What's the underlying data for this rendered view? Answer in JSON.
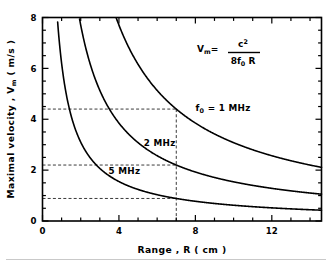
{
  "figure": {
    "background_color": "#ffffff",
    "ink_color": "#000000",
    "dash_color": "#3a3a3a",
    "footer_rule": true
  },
  "formula": {
    "lhs": "V",
    "lhs_sub": "m",
    "equals": "=",
    "numerator": "c",
    "numerator_sup": "2",
    "denominator_pre": "8f",
    "denominator_sub": "0",
    "denominator_post": "R",
    "full_text": "Vm = c2 / 8f0R"
  },
  "chart_data": {
    "type": "line",
    "title": "",
    "subtitle": "",
    "xlabel": "Range ,  R   ( cm )",
    "ylabel": "Maximal velocity ,  V_m  ( m/s )",
    "xlim": [
      0,
      14.6
    ],
    "ylim": [
      0,
      8
    ],
    "xticks": [
      0,
      4,
      8,
      12
    ],
    "xtick_labels": [
      "0",
      "4",
      "8",
      "12"
    ],
    "xminor_step": 1,
    "yticks": [
      0,
      2,
      4,
      6,
      8
    ],
    "ytick_labels": [
      "0",
      "2",
      "4",
      "6",
      "8"
    ],
    "yminor_step": 0.5,
    "grid": false,
    "legend_position": "inline-curve-labels",
    "relation": "Vm = k / R",
    "series": [
      {
        "name": "f0 = 1 MHz",
        "label": "f₀ =  1  MHz",
        "k": 30.8,
        "label_x": 8.0,
        "label_y": 4.45,
        "points": [
          {
            "x": 3.85,
            "y": 8.0
          },
          {
            "x": 4.5,
            "y": 6.84
          },
          {
            "x": 5.5,
            "y": 5.6
          },
          {
            "x": 6.5,
            "y": 4.74
          },
          {
            "x": 7.0,
            "y": 4.4
          },
          {
            "x": 8.0,
            "y": 3.85
          },
          {
            "x": 9.0,
            "y": 3.42
          },
          {
            "x": 10.0,
            "y": 3.08
          },
          {
            "x": 11.0,
            "y": 2.8
          },
          {
            "x": 12.0,
            "y": 2.57
          },
          {
            "x": 13.0,
            "y": 2.37
          },
          {
            "x": 14.0,
            "y": 2.2
          },
          {
            "x": 14.6,
            "y": 2.11
          }
        ]
      },
      {
        "name": "2 MHz",
        "label": "2  MHz",
        "k": 15.4,
        "label_x": 5.3,
        "label_y": 3.05,
        "points": [
          {
            "x": 1.93,
            "y": 8.0
          },
          {
            "x": 2.5,
            "y": 6.16
          },
          {
            "x": 3.0,
            "y": 5.13
          },
          {
            "x": 4.0,
            "y": 3.85
          },
          {
            "x": 5.0,
            "y": 3.08
          },
          {
            "x": 6.0,
            "y": 2.57
          },
          {
            "x": 7.0,
            "y": 2.2
          },
          {
            "x": 8.0,
            "y": 1.93
          },
          {
            "x": 9.0,
            "y": 1.71
          },
          {
            "x": 10.0,
            "y": 1.54
          },
          {
            "x": 11.0,
            "y": 1.4
          },
          {
            "x": 12.0,
            "y": 1.28
          },
          {
            "x": 13.0,
            "y": 1.18
          },
          {
            "x": 14.0,
            "y": 1.1
          },
          {
            "x": 14.6,
            "y": 1.05
          }
        ]
      },
      {
        "name": "5 MHz",
        "label": "5  MHz",
        "k": 6.2,
        "label_x": 3.45,
        "label_y": 1.95,
        "points": [
          {
            "x": 0.78,
            "y": 8.0
          },
          {
            "x": 1.0,
            "y": 6.2
          },
          {
            "x": 1.5,
            "y": 4.13
          },
          {
            "x": 2.0,
            "y": 3.1
          },
          {
            "x": 3.0,
            "y": 2.07
          },
          {
            "x": 4.0,
            "y": 1.55
          },
          {
            "x": 5.0,
            "y": 1.24
          },
          {
            "x": 6.0,
            "y": 1.03
          },
          {
            "x": 7.0,
            "y": 0.886
          },
          {
            "x": 8.0,
            "y": 0.775
          },
          {
            "x": 9.0,
            "y": 0.689
          },
          {
            "x": 10.0,
            "y": 0.62
          },
          {
            "x": 11.0,
            "y": 0.564
          },
          {
            "x": 12.0,
            "y": 0.517
          },
          {
            "x": 13.0,
            "y": 0.477
          },
          {
            "x": 14.0,
            "y": 0.443
          },
          {
            "x": 14.6,
            "y": 0.425
          }
        ]
      }
    ],
    "annotations": {
      "vertical_guide_x": 7.0,
      "horizontal_guides_y": [
        4.4,
        2.2,
        0.886
      ],
      "style": "dashed"
    }
  }
}
